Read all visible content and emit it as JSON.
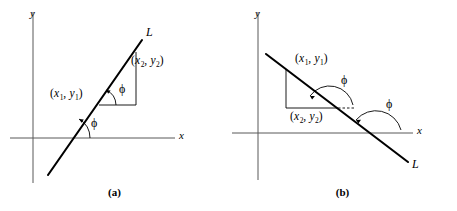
{
  "figure": {
    "kind": "math-diagram",
    "background_color": "#ffffff",
    "axis_color": "#585858",
    "line_color": "#000000"
  },
  "panels": [
    {
      "id": "a",
      "caption": "(a)",
      "axis_x_label": "x",
      "axis_y_label": "y",
      "line_label": "L",
      "point1_label": {
        "open": "(",
        "x": "x",
        "xsub": "1",
        "comma": ", ",
        "y": "y",
        "ysub": "1",
        "close": ")"
      },
      "point2_label": {
        "open": "(",
        "x": "x",
        "xsub": "2",
        "comma": ", ",
        "y": "y",
        "ysub": "2",
        "close": ")"
      },
      "angle_label_upper": "ϕ",
      "angle_label_lower": "ϕ",
      "slope_sense": "positive"
    },
    {
      "id": "b",
      "caption": "(b)",
      "axis_x_label": "x",
      "axis_y_label": "y",
      "line_label": "L",
      "point1_label": {
        "open": "(",
        "x": "x",
        "xsub": "1",
        "comma": ", ",
        "y": "y",
        "ysub": "1",
        "close": ")"
      },
      "point2_label": {
        "open": "(",
        "x": "x",
        "xsub": "2",
        "comma": ", ",
        "y": "y",
        "ysub": "2",
        "close": ")"
      },
      "angle_label_upper": "ϕ",
      "angle_label_lower": "ϕ",
      "slope_sense": "negative"
    }
  ]
}
